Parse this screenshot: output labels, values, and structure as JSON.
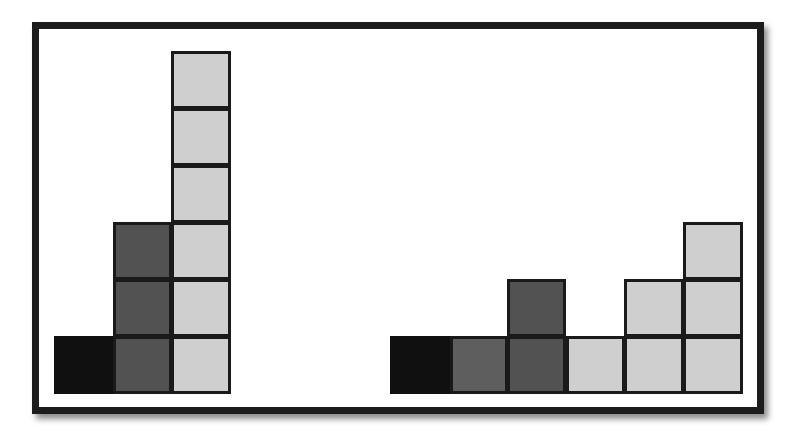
{
  "diagram": {
    "colors": {
      "black": "#101010",
      "dark_gray": "#525252",
      "medium_gray": "#5e5e5e",
      "light_gray": "#cfcfcf",
      "frame": "#1c1c1c"
    },
    "left_group": {
      "columns": [
        {
          "color": "black",
          "height": 1
        },
        {
          "color": "dark_gray",
          "height": 3
        },
        {
          "color": "light_gray",
          "height": 6
        }
      ]
    },
    "right_group": {
      "columns": [
        {
          "color": "black",
          "height": 1
        },
        {
          "color": "medium_gray",
          "height": 1
        },
        {
          "color": "dark_gray",
          "height": 2
        },
        {
          "color": "light_gray",
          "height": 1
        },
        {
          "color": "light_gray",
          "height": 2
        },
        {
          "color": "light_gray",
          "height": 3
        }
      ]
    }
  }
}
